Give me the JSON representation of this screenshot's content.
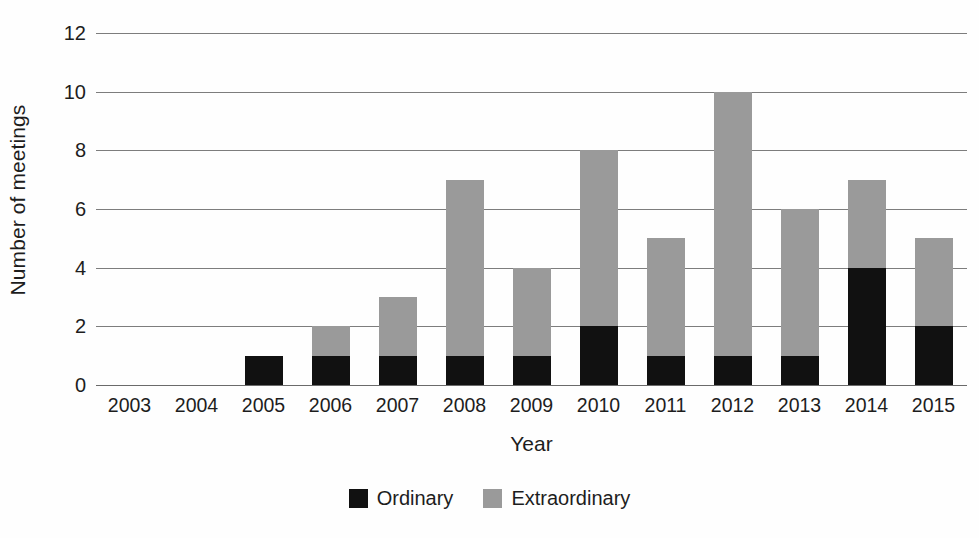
{
  "chart_data": {
    "type": "bar",
    "subtype": "stacked-vertical",
    "title": "",
    "xlabel": "Year",
    "ylabel": "Number of meetings",
    "categories": [
      "2003",
      "2004",
      "2005",
      "2006",
      "2007",
      "2008",
      "2009",
      "2010",
      "2011",
      "2012",
      "2013",
      "2014",
      "2015"
    ],
    "series": [
      {
        "name": "Ordinary",
        "color": "#111111",
        "values": [
          0,
          0,
          1,
          1,
          1,
          1,
          1,
          2,
          1,
          1,
          1,
          4,
          2
        ]
      },
      {
        "name": "Extraordinary",
        "color": "#9a9a9a",
        "values": [
          0,
          0,
          0,
          1,
          2,
          6,
          3,
          6,
          4,
          9,
          5,
          3,
          3
        ]
      }
    ],
    "totals": [
      0,
      0,
      1,
      2,
      3,
      7,
      4,
      8,
      5,
      10,
      6,
      7,
      5
    ],
    "ylim": [
      0,
      12
    ],
    "ytick_values": [
      0,
      2,
      4,
      6,
      8,
      10,
      12
    ],
    "ytick_labels": [
      "0",
      "2",
      "4",
      "6",
      "8",
      "10",
      "12"
    ],
    "grid": true,
    "grid_axis": "y",
    "legend_position": "bottom-center",
    "background_color": "#fefefe",
    "gridline_color": "#7d7d7d",
    "text_color": "#1d1d1d"
  },
  "legend": {
    "items": [
      {
        "label": "Ordinary",
        "color": "#111111"
      },
      {
        "label": "Extraordinary",
        "color": "#9a9a9a"
      }
    ]
  }
}
